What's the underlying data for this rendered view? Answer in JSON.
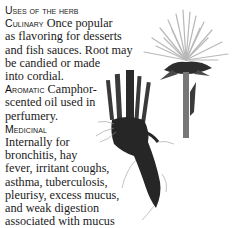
{
  "heading": "Uses of the herb",
  "sections": {
    "culinary": {
      "label": "Culinary",
      "text_lines": [
        "Once popular",
        "as flavoring for desserts",
        "and fish sauces. Root may",
        "be candied or made",
        "into cordial."
      ]
    },
    "aromatic": {
      "label": "Aromatic",
      "text_lines": [
        "Camphor-",
        "scented oil used in",
        "perfumery."
      ]
    },
    "medicinal": {
      "label": "Medicinal",
      "text_lines": [
        "Internally for",
        "bronchitis, hay",
        "fever, irritant coughs,",
        "asthma, tuberculosis,",
        "pleurisy, excess mucus,",
        "and weak digestion",
        "associated with mucus",
        "formation. Not given to pregnant women."
      ]
    }
  },
  "illustrations": {
    "flower": "herb-flower-head",
    "root": "herb-root"
  }
}
